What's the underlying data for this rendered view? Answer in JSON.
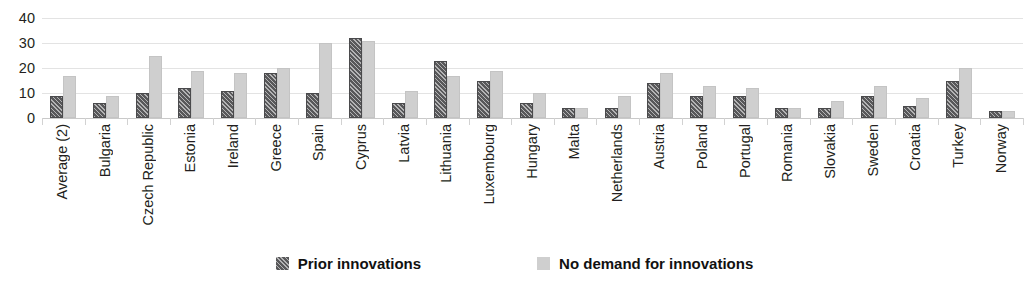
{
  "chart_data": {
    "type": "bar",
    "title": "",
    "xlabel": "",
    "ylabel": "",
    "ylim": [
      0,
      40
    ],
    "yticks": [
      0,
      10,
      20,
      30,
      40
    ],
    "grid": true,
    "legend_position": "bottom",
    "categories": [
      "Average (2)",
      "Bulgaria",
      "Czech Republic",
      "Estonia",
      "Ireland",
      "Greece",
      "Spain",
      "Cyprus",
      "Latvia",
      "Lithuania",
      "Luxembourg",
      "Hungary",
      "Malta",
      "Netherlands",
      "Austria",
      "Poland",
      "Portugal",
      "Romania",
      "Slovakia",
      "Sweden",
      "Croatia",
      "Turkey",
      "Norway"
    ],
    "series": [
      {
        "name": "Prior innovations",
        "color": "#58585a",
        "pattern": "diagonal-hatch",
        "values": [
          9,
          6,
          10,
          12,
          11,
          18,
          10,
          32,
          6,
          23,
          15,
          6,
          4,
          4,
          14,
          9,
          9,
          4,
          4,
          9,
          5,
          15,
          3
        ]
      },
      {
        "name": "No demand for innovations",
        "color": "#cfcfcf",
        "pattern": "solid",
        "values": [
          17,
          9,
          25,
          19,
          18,
          20,
          30,
          31,
          11,
          17,
          19,
          10,
          4,
          9,
          18,
          13,
          12,
          4,
          7,
          13,
          8,
          20,
          3
        ]
      }
    ]
  },
  "legend": {
    "items": [
      {
        "label": "Prior innovations",
        "swatch": "dark-hatched-swatch"
      },
      {
        "label": "No demand for innovations",
        "swatch": "light-gray-swatch"
      }
    ]
  }
}
